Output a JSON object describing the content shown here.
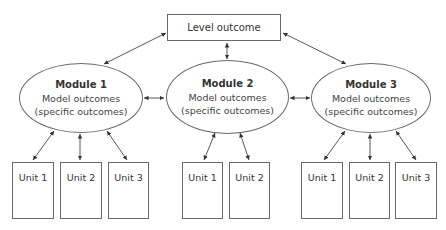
{
  "diagram": {
    "level": {
      "label": "Level outcome"
    },
    "modules": [
      {
        "title": "Module 1",
        "line1": "Model outcomes",
        "line2": "(specific outcomes)",
        "units": [
          {
            "label": "Unit 1"
          },
          {
            "label": "Unit 2"
          },
          {
            "label": "Unit 3"
          }
        ]
      },
      {
        "title": "Module 2",
        "line1": "Model outcomes",
        "line2": "(specific outcomes)",
        "units": [
          {
            "label": "Unit 1"
          },
          {
            "label": "Unit 2"
          }
        ]
      },
      {
        "title": "Module 3",
        "line1": "Model outcomes",
        "line2": "(specific outcomes)",
        "units": [
          {
            "label": "Unit 1"
          },
          {
            "label": "Unit 2"
          },
          {
            "label": "Unit 3"
          }
        ]
      }
    ],
    "colors": {
      "stroke": "#6a6a6a",
      "text": "#333333",
      "background": "#ffffff"
    }
  }
}
